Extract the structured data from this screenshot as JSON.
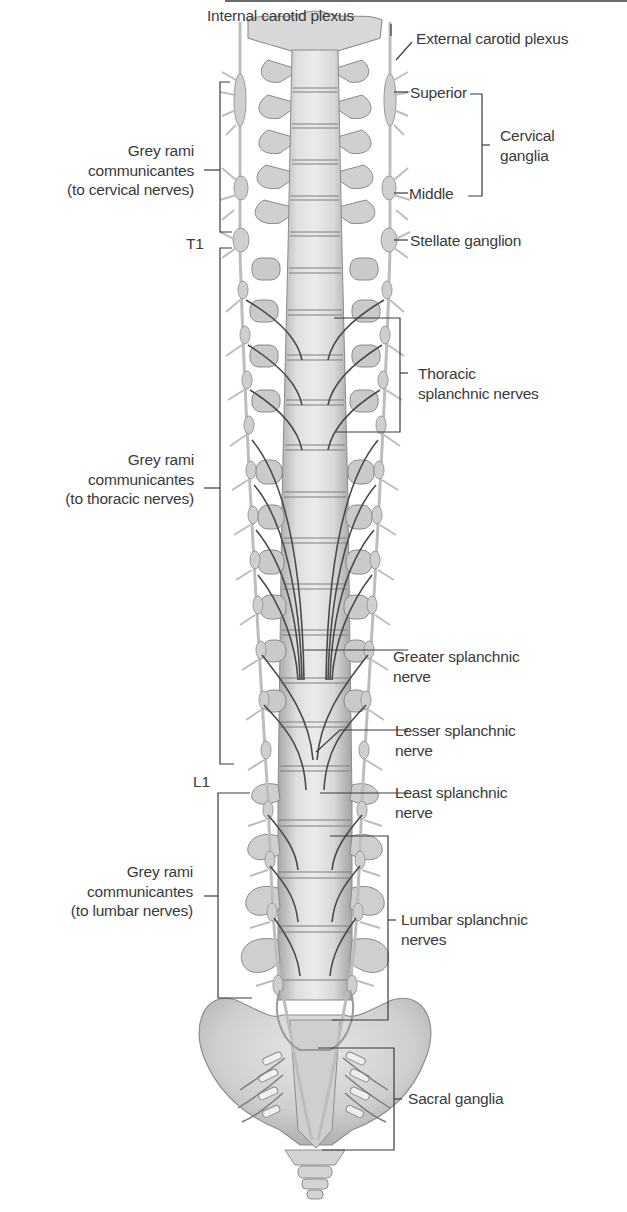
{
  "figure": {
    "colors": {
      "background": "#ffffff",
      "bone": "#d6d6d6",
      "bone_shadow": "#9c9c9c",
      "nerve": "#bcbcbc",
      "splanchnic_nerve": "#444444",
      "leader_line": "#3a3a3a",
      "label_text": "#3a3a3a"
    }
  },
  "labels": {
    "internal_carotid": "Internal carotid plexus",
    "external_carotid": "External carotid plexus",
    "superior": "Superior",
    "middle": "Middle",
    "cervical_ganglia": [
      "Cervical",
      "ganglia"
    ],
    "stellate": "Stellate ganglion",
    "grey_cervical": [
      "Grey rami",
      "communicantes",
      "(to cervical nerves)"
    ],
    "t1": "T1",
    "thoracic_splanchnic": [
      "Thoracic",
      "splanchnic nerves"
    ],
    "grey_thoracic": [
      "Grey rami",
      "communicantes",
      "(to thoracic nerves)"
    ],
    "greater_splanchnic": [
      "Greater splanchnic",
      "nerve"
    ],
    "lesser_splanchnic": [
      "Lesser splanchnic",
      "nerve"
    ],
    "least_splanchnic": [
      "Least splanchnic",
      "nerve"
    ],
    "l1": "L1",
    "grey_lumbar": [
      "Grey rami",
      "communicantes",
      "(to lumbar nerves)"
    ],
    "lumbar_splanchnic": [
      "Lumbar splanchnic",
      "nerves"
    ],
    "sacral_ganglia": "Sacral ganglia"
  }
}
